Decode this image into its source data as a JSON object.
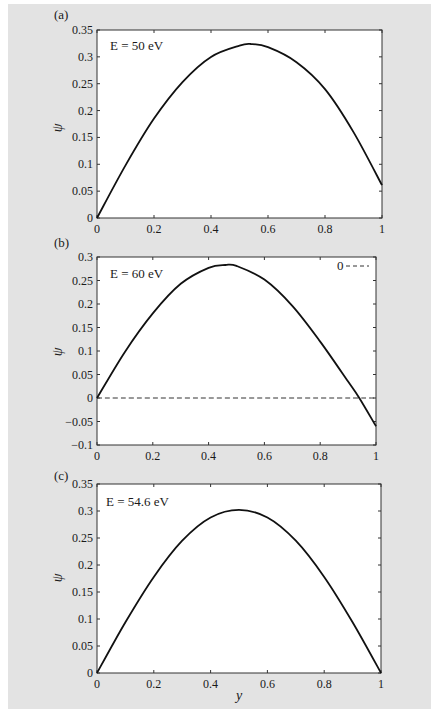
{
  "figure": {
    "background": "#e3e3e3",
    "plot_background": "#ffffff",
    "line_color": "#111111"
  },
  "chart_data": [
    {
      "type": "line",
      "panel_label": "(a)",
      "annotation": "E = 50 eV",
      "xlabel": "",
      "ylabel": "ψ",
      "xlim": [
        0,
        1
      ],
      "ylim": [
        0,
        0.35
      ],
      "xticks": [
        "0",
        "0.2",
        "0.4",
        "0.6",
        "0.8",
        "1"
      ],
      "yticks": [
        "0",
        "0.05",
        "0.1",
        "0.15",
        "0.2",
        "0.25",
        "0.3",
        "0.35"
      ],
      "grid": false,
      "series": [
        {
          "name": "ψ (E = 50 eV)",
          "style": "solid",
          "x": [
            0,
            0.1,
            0.2,
            0.3,
            0.4,
            0.5,
            0.54,
            0.6,
            0.7,
            0.8,
            0.9,
            1.0
          ],
          "values": [
            0,
            0.098,
            0.185,
            0.253,
            0.3,
            0.321,
            0.324,
            0.318,
            0.29,
            0.24,
            0.16,
            0.061
          ]
        }
      ]
    },
    {
      "type": "line",
      "panel_label": "(b)",
      "annotation": "E = 60 eV",
      "xlabel": "",
      "ylabel": "ψ",
      "xlim": [
        0,
        1
      ],
      "ylim": [
        -0.1,
        0.3
      ],
      "xticks": [
        "0",
        "0.2",
        "0.4",
        "0.6",
        "0.8",
        "1"
      ],
      "yticks": [
        "−0.1",
        "−0.05",
        "0",
        "0.05",
        "0.1",
        "0.15",
        "0.2",
        "0.25",
        "0.3"
      ],
      "grid": false,
      "legend": {
        "position": "upper right",
        "entries": [
          {
            "label": "0",
            "style": "dashed"
          }
        ]
      },
      "series": [
        {
          "name": "ψ (E = 60 eV)",
          "style": "solid",
          "x": [
            0,
            0.1,
            0.2,
            0.3,
            0.4,
            0.46,
            0.5,
            0.6,
            0.7,
            0.8,
            0.9,
            0.94,
            1.0
          ],
          "values": [
            0,
            0.098,
            0.18,
            0.243,
            0.277,
            0.283,
            0.281,
            0.252,
            0.196,
            0.12,
            0.035,
            0.0,
            -0.06
          ]
        },
        {
          "name": "0",
          "style": "dashed",
          "x": [
            0,
            1
          ],
          "values": [
            0,
            0
          ]
        }
      ]
    },
    {
      "type": "line",
      "panel_label": "(c)",
      "annotation": "E = 54.6 eV",
      "xlabel": "y",
      "ylabel": "ψ",
      "xlim": [
        0,
        1
      ],
      "ylim": [
        0,
        0.35
      ],
      "xticks": [
        "0",
        "0.2",
        "0.4",
        "0.6",
        "0.8",
        "1"
      ],
      "yticks": [
        "0",
        "0.05",
        "0.1",
        "0.15",
        "0.2",
        "0.25",
        "0.3",
        "0.35"
      ],
      "grid": false,
      "series": [
        {
          "name": "ψ (E = 54.6 eV)",
          "style": "solid",
          "x": [
            0,
            0.1,
            0.2,
            0.3,
            0.4,
            0.5,
            0.6,
            0.7,
            0.8,
            0.9,
            1.0
          ],
          "values": [
            0,
            0.094,
            0.178,
            0.245,
            0.288,
            0.302,
            0.288,
            0.245,
            0.178,
            0.094,
            0
          ]
        }
      ]
    }
  ]
}
